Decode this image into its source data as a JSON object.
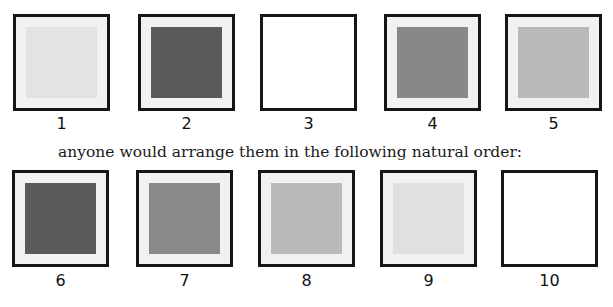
{
  "top_row": {
    "swatches": [
      {
        "label": "1",
        "fill": "#e3e3e2",
        "has_inner": true
      },
      {
        "label": "2",
        "fill": "#595959",
        "has_inner": true
      },
      {
        "label": "3",
        "fill": "#ffffff",
        "has_inner": false
      },
      {
        "label": "4",
        "fill": "#888888",
        "has_inner": true
      },
      {
        "label": "5",
        "fill": "#b9b9b9",
        "has_inner": true
      }
    ]
  },
  "caption": "anyone would arrange them in the following natural order:",
  "bottom_row": {
    "swatches": [
      {
        "label": "6",
        "fill": "#595959",
        "has_inner": true
      },
      {
        "label": "7",
        "fill": "#8a8a8a",
        "has_inner": true
      },
      {
        "label": "8",
        "fill": "#bababa",
        "has_inner": true
      },
      {
        "label": "9",
        "fill": "#e0e0df",
        "has_inner": true
      },
      {
        "label": "10",
        "fill": "#ffffff",
        "has_inner": false
      }
    ]
  }
}
